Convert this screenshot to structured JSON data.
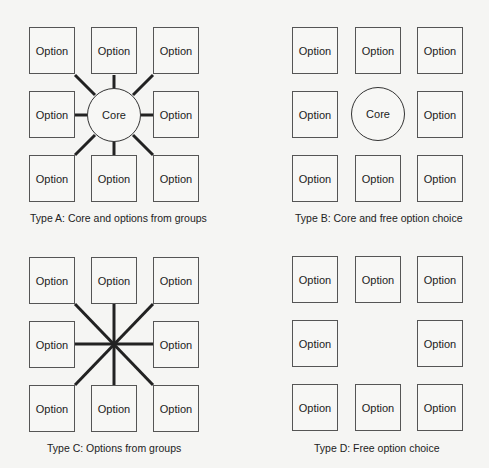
{
  "option_label": "Option",
  "core_label": "Core",
  "colors": {
    "background": "#f5f5f3",
    "stroke": "#555555",
    "connector": "#222222"
  },
  "panels": [
    {
      "id": "A",
      "caption": "Type A: Core and options from groups",
      "has_core": true,
      "connectors": "core-spokes",
      "option_count": 8
    },
    {
      "id": "B",
      "caption": "Type B: Core and free option choice",
      "has_core": true,
      "connectors": "none",
      "option_count": 8
    },
    {
      "id": "C",
      "caption": "Type C: Options from groups",
      "has_core": false,
      "connectors": "star",
      "option_count": 8
    },
    {
      "id": "D",
      "caption": "Type D: Free option choice",
      "has_core": false,
      "connectors": "none",
      "option_count": 8
    }
  ]
}
